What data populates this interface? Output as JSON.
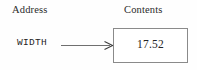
{
  "diagram": {
    "columns": [
      {
        "id": "address",
        "label": "Address"
      },
      {
        "id": "contents",
        "label": "Contents"
      }
    ],
    "rows": [
      {
        "address_label": "WIDTH",
        "contents_value": "17.52",
        "connector": {
          "icon": "right-arrow-icon",
          "direction": "left-to-right",
          "style": "thin-line-open-head"
        }
      }
    ],
    "colors": {
      "background": "#fefefe",
      "box_border": "#8a8a8a",
      "box_fill": "#ffffff",
      "header_text": "#2a2a2a",
      "address_text": "#1f1f1f",
      "value_text": "#242424",
      "arrow_line": "#6f6f6f",
      "arrow_head": "#3d3d3d"
    }
  }
}
